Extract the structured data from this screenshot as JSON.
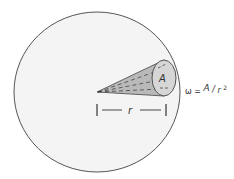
{
  "diagram": {
    "labels": {
      "area": "A",
      "radius": "r",
      "formula_lhs": "ω =",
      "formula_num": "A",
      "formula_sep": "/",
      "formula_den": "r",
      "formula_exp": "2"
    },
    "colors": {
      "sphere_fill": "#f4f4f4",
      "sphere_stroke": "#555555",
      "cone_fill": "#b9b9b9",
      "cap_fill": "#d6d6d6",
      "line": "#333333"
    }
  }
}
